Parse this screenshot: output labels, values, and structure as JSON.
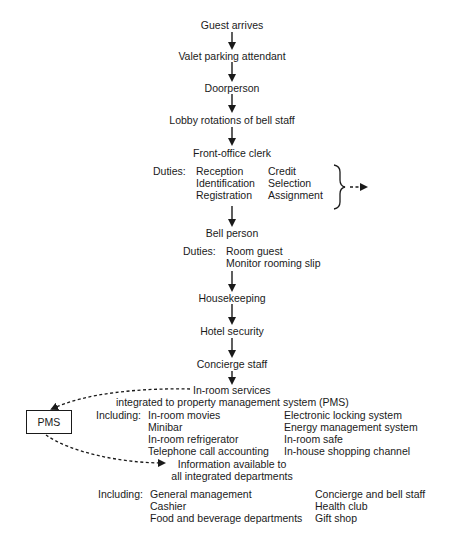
{
  "flow": {
    "steps": [
      {
        "label": "Guest arrives"
      },
      {
        "label": "Valet parking attendant"
      },
      {
        "label": "Doorperson"
      },
      {
        "label": "Lobby rotations of bell staff"
      },
      {
        "label": "Front-office clerk"
      },
      {
        "label": "Bell person"
      },
      {
        "label": "Housekeeping"
      },
      {
        "label": "Hotel security"
      },
      {
        "label": "Concierge staff"
      }
    ],
    "front_office_duties": {
      "label": "Duties:",
      "col1": [
        "Reception",
        "Identification",
        "Registration"
      ],
      "col2": [
        "Credit",
        "Selection",
        "Assignment"
      ]
    },
    "bell_duties": {
      "label": "Duties:",
      "items": [
        "Room guest",
        "Monitor rooming slip"
      ]
    },
    "in_room": {
      "title_line1": "In-room services",
      "title_line2": "integrated to property management system (PMS)",
      "including_label": "Including:",
      "col1": [
        "In-room movies",
        "Minibar",
        "In-room refrigerator",
        "Telephone call accounting"
      ],
      "col2": [
        "Electronic locking system",
        "Energy management system",
        "In-room safe",
        "In-house shopping channel"
      ]
    },
    "pms": {
      "label": "PMS"
    },
    "info": {
      "line1": "Information available to",
      "line2": "all integrated departments",
      "including_label": "Including:",
      "col1": [
        "General management",
        "Cashier",
        "Food and beverage departments"
      ],
      "col2": [
        "Concierge and bell staff",
        "Health club",
        "Gift shop"
      ]
    }
  }
}
